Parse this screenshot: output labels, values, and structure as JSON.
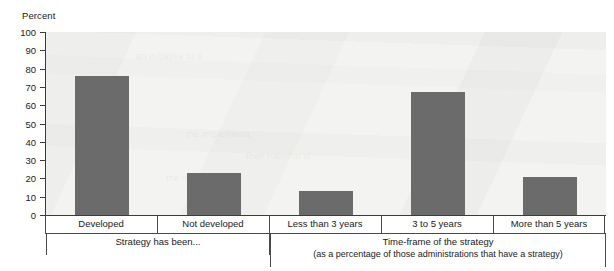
{
  "chart_data": {
    "type": "bar",
    "title": "",
    "subtitle": "",
    "ylabel": "Percent",
    "xlabel": "",
    "ylim": [
      0,
      100
    ],
    "ytick_step": 10,
    "yticks": [
      "100",
      "90",
      "80",
      "70",
      "60",
      "50",
      "40",
      "30",
      "20",
      "10",
      "0"
    ],
    "grid": false,
    "legend": "none",
    "bar_color": "#6b6b6b",
    "plot_background": "#f3f3f1",
    "axis_color": "#3b3b3b",
    "categories": [
      "Developed",
      "Not developed",
      "Less than 3 years",
      "3 to 5 years",
      "More than 5 years"
    ],
    "values": [
      76,
      23,
      13,
      67,
      21
    ],
    "groups": [
      {
        "caption": "Strategy has been...",
        "subcaption": "",
        "categories": [
          "Developed",
          "Not developed"
        ]
      },
      {
        "caption": "Time-frame of the strategy",
        "subcaption": "(as a percentage of those administrations that have a strategy)",
        "categories": [
          "Less than 3 years",
          "3 to 5 years",
          "More than 5 years"
        ]
      }
    ]
  },
  "bleed_text": {
    "line1": "an initiative to a",
    "line2": "the implementa",
    "line3": "their national st",
    "line4": "the majority of"
  }
}
